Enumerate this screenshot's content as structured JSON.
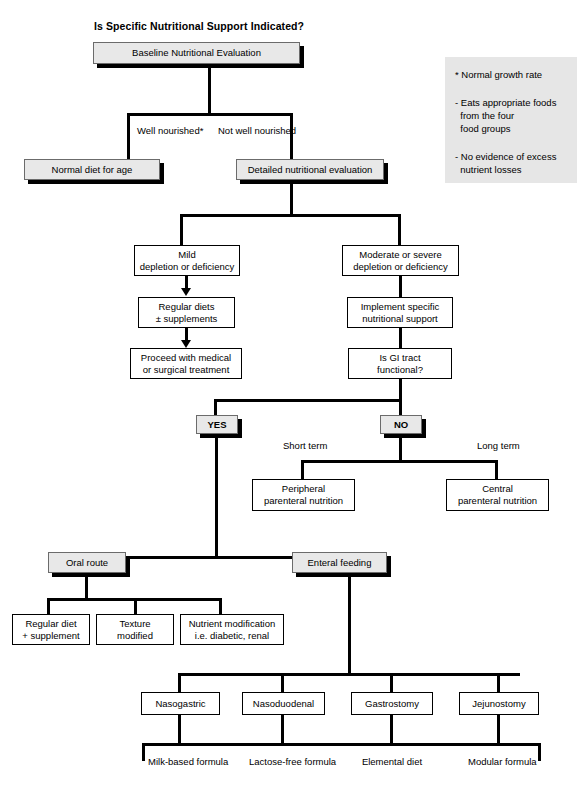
{
  "title": "Is Specific Nutritional Support Indicated?",
  "nodes": {
    "baseline": "Baseline Nutritional Evaluation",
    "normal_diet": "Normal diet for age",
    "detailed_eval": "Detailed nutritional evaluation",
    "mild_l1": "Mild",
    "mild_l2": "depletion or deficiency",
    "moderate_l1": "Moderate or severe",
    "moderate_l2": "depletion or deficiency",
    "regular_diets_l1": "Regular diets",
    "regular_diets_l2": "± supplements",
    "implement_l1": "Implement specific",
    "implement_l2": "nutritional support",
    "proceed_l1": "Proceed with medical",
    "proceed_l2": "or surgical treatment",
    "gi_tract_l1": "Is GI tract",
    "gi_tract_l2": "functional?",
    "yes": "YES",
    "no": "NO",
    "peripheral_l1": "Peripheral",
    "peripheral_l2": "parenteral nutrition",
    "central_l1": "Central",
    "central_l2": "parenteral nutrition",
    "oral_route": "Oral route",
    "enteral_feeding": "Enteral feeding",
    "regular_diet_l1": "Regular diet",
    "regular_diet_l2": "+ supplement",
    "texture_l1": "Texture",
    "texture_l2": "modified",
    "nutrient_mod_l1": "Nutrient modification",
    "nutrient_mod_l2": "i.e. diabetic, renal",
    "nasogastric": "Nasogastric",
    "nasoduodenal": "Nasoduodenal",
    "gastrostomy": "Gastrostomy",
    "jejunostomy": "Jejunostomy",
    "milk_l1": "Milk-based",
    "milk_l2": "formula",
    "lactose_l1": "Lactose-free",
    "lactose_l2": "formula",
    "elemental_l1": "Elemental",
    "elemental_l2": "diet",
    "modular_l1": "Modular",
    "modular_l2": "formula"
  },
  "edge_labels": {
    "well_nourished": "Well nourished*",
    "not_well_nourished": "Not well nourished",
    "short_term": "Short term",
    "long_term": "Long term"
  },
  "legend": {
    "line1": "* Normal growth rate",
    "line2": "- Eats appropriate foods",
    "line3": "  from the four",
    "line4": "  food groups",
    "line5": "- No evidence of excess",
    "line6": "  nutrient losses"
  },
  "colors": {
    "shaded_box_fill": "#e8e8e8",
    "legend_fill": "#e6e6e6",
    "line": "#000000",
    "page_background": "#ffffff"
  }
}
